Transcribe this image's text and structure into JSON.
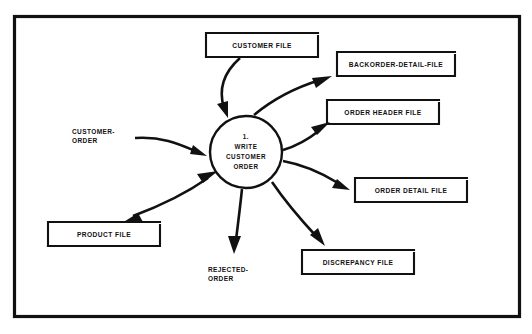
{
  "diagram": {
    "type": "data-flow-diagram",
    "title": "",
    "frame": {
      "present": true,
      "color": "#111111"
    },
    "process": {
      "id": "1",
      "number_label": "1.",
      "lines": [
        "1.",
        "WRITE",
        "CUSTOMER",
        "ORDER"
      ],
      "name": "WRITE CUSTOMER ORDER",
      "shape": "circle",
      "cx": 246,
      "cy": 152,
      "r": 36
    },
    "data_stores": [
      {
        "id": "customer-file",
        "label": "CUSTOMER FILE",
        "x": 206,
        "y": 33,
        "width": 112,
        "height": 24
      },
      {
        "id": "backorder-detail-file",
        "label": "BACKORDER-DETAIL-FILE",
        "x": 337,
        "y": 52,
        "width": 118,
        "height": 24
      },
      {
        "id": "order-header-file",
        "label": "ORDER HEADER FILE",
        "x": 327,
        "y": 100,
        "width": 112,
        "height": 24
      },
      {
        "id": "order-detail-file",
        "label": "ORDER DETAIL FILE",
        "x": 355,
        "y": 178,
        "width": 112,
        "height": 24
      },
      {
        "id": "discrepancy-file",
        "label": "DISCREPANCY FILE",
        "x": 302,
        "y": 250,
        "width": 112,
        "height": 24
      },
      {
        "id": "product-file",
        "label": "PRODUCT FILE",
        "x": 48,
        "y": 222,
        "width": 112,
        "height": 24
      }
    ],
    "data_flows": [
      {
        "id": "customer-order-in",
        "label": "CUSTOMER-ORDER",
        "label_lines": [
          "CUSTOMER-",
          "ORDER"
        ],
        "from": "external",
        "to": "process-1",
        "direction": "in"
      },
      {
        "id": "rejected-order-out",
        "label": "REJECTED-ORDER",
        "label_lines": [
          "REJECTED-",
          "ORDER"
        ],
        "from": "process-1",
        "to": "external",
        "direction": "out"
      },
      {
        "id": "customer-file-read",
        "label": "",
        "from": "customer-file",
        "to": "process-1",
        "direction": "in"
      },
      {
        "id": "backorder-detail-write",
        "label": "",
        "from": "process-1",
        "to": "backorder-detail-file",
        "direction": "out"
      },
      {
        "id": "order-header-write",
        "label": "",
        "from": "process-1",
        "to": "order-header-file",
        "direction": "out"
      },
      {
        "id": "order-detail-write",
        "label": "",
        "from": "process-1",
        "to": "order-detail-file",
        "direction": "out"
      },
      {
        "id": "discrepancy-write",
        "label": "",
        "from": "process-1",
        "to": "discrepancy-file",
        "direction": "out"
      },
      {
        "id": "product-file-readwrite",
        "label": "",
        "from": "process-1",
        "to": "product-file",
        "direction": "bidirectional"
      }
    ]
  }
}
